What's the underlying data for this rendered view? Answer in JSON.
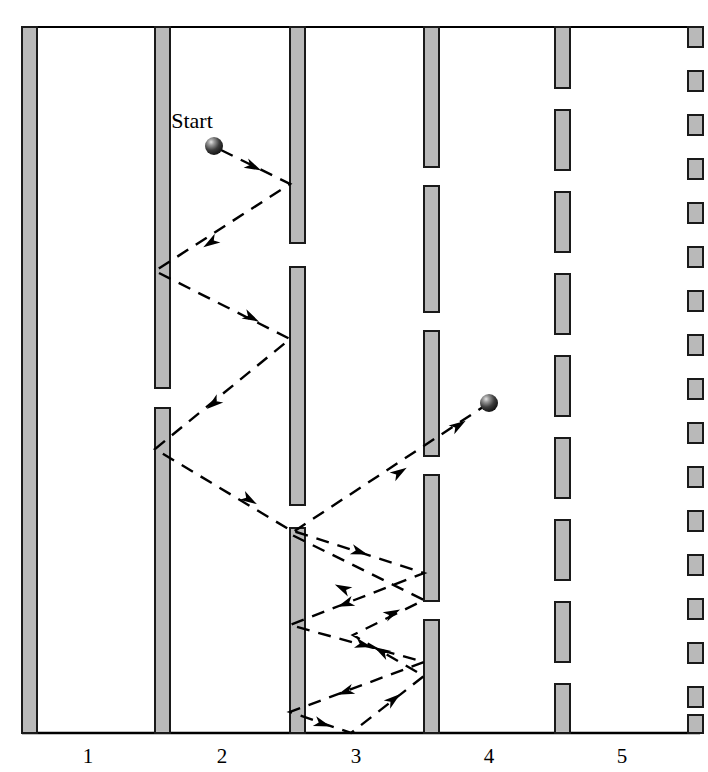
{
  "figure": {
    "title": "",
    "start_label": "Start",
    "axis": {
      "tick_labels": [
        "1",
        "2",
        "3",
        "4",
        "5"
      ],
      "tick_label_x": [
        88,
        222,
        356,
        489,
        622
      ],
      "tick_label_y": 763,
      "baseline_y": 733,
      "baseline_x0": 22,
      "baseline_x1": 700,
      "top_border_y": 27,
      "top_border_x0": 22,
      "top_border_x1": 700
    },
    "colors": {
      "barrier_fill": "#b9b9b9",
      "barrier_stroke": "#1a1a1a",
      "trajectory": "#000000",
      "axis": "#000000",
      "ball_dark": "#141414",
      "ball_mid": "#4a4a4a",
      "ball_highlight": "#d8d8d8",
      "background": "#ffffff"
    },
    "barrier_width": 15,
    "barriers": [
      {
        "name": "column-1-solid",
        "x": 22,
        "segments": [
          [
            27,
            733
          ]
        ]
      },
      {
        "name": "column-2-broken",
        "x": 155,
        "segments": [
          [
            27,
            388
          ],
          [
            408,
            733
          ]
        ]
      },
      {
        "name": "column-3-broken",
        "x": 290,
        "segments": [
          [
            27,
            243
          ],
          [
            267,
            505
          ],
          [
            528,
            733
          ]
        ]
      },
      {
        "name": "column-4-dashed",
        "x": 424,
        "segments": [
          [
            27,
            167
          ],
          [
            186,
            312
          ],
          [
            331,
            456
          ],
          [
            475,
            601
          ],
          [
            620,
            733
          ]
        ]
      },
      {
        "name": "column-5-dashed",
        "x": 555,
        "segments": [
          [
            27,
            88
          ],
          [
            110,
            170
          ],
          [
            192,
            252
          ],
          [
            274,
            334
          ],
          [
            356,
            416
          ],
          [
            438,
            498
          ],
          [
            520,
            580
          ],
          [
            602,
            662
          ],
          [
            684,
            733
          ]
        ]
      },
      {
        "name": "column-6-dotted",
        "x": 688,
        "segments": [
          [
            27,
            47
          ],
          [
            71,
            91
          ],
          [
            115,
            135
          ],
          [
            159,
            179
          ],
          [
            203,
            223
          ],
          [
            247,
            267
          ],
          [
            291,
            311
          ],
          [
            335,
            355
          ],
          [
            379,
            399
          ],
          [
            423,
            443
          ],
          [
            467,
            487
          ],
          [
            511,
            531
          ],
          [
            555,
            575
          ],
          [
            599,
            619
          ],
          [
            643,
            663
          ],
          [
            687,
            707
          ],
          [
            715,
            733
          ]
        ]
      }
    ],
    "balls": [
      {
        "name": "start-ball",
        "cx": 214,
        "cy": 146,
        "r": 9
      },
      {
        "name": "end-ball",
        "cx": 489,
        "cy": 403,
        "r": 9
      }
    ],
    "trajectory": {
      "name": "ball-path",
      "dash_pattern": "13 9",
      "stroke_width": 2.4,
      "points": [
        [
          221,
          150
        ],
        [
          290,
          184
        ],
        [
          155,
          271
        ],
        [
          290,
          339
        ],
        [
          155,
          449
        ],
        [
          290,
          530
        ],
        [
          424,
          573
        ],
        [
          290,
          625
        ],
        [
          424,
          662
        ],
        [
          290,
          712
        ],
        [
          351,
          733
        ],
        [
          424,
          676
        ],
        [
          353,
          635
        ],
        [
          424,
          600
        ],
        [
          290,
          534
        ],
        [
          489,
          403
        ]
      ],
      "arrows": [
        {
          "x": 254,
          "y": 167,
          "angle": 26
        },
        {
          "x": 210,
          "y": 243,
          "angle": 147
        },
        {
          "x": 252,
          "y": 318,
          "angle": 27
        },
        {
          "x": 213,
          "y": 404,
          "angle": 141
        },
        {
          "x": 250,
          "y": 500,
          "angle": 31
        },
        {
          "x": 360,
          "y": 552,
          "angle": 18
        },
        {
          "x": 345,
          "y": 604,
          "angle": 159
        },
        {
          "x": 364,
          "y": 645,
          "angle": 15
        },
        {
          "x": 345,
          "y": 692,
          "angle": 160
        },
        {
          "x": 323,
          "y": 724,
          "angle": 19
        },
        {
          "x": 394,
          "y": 699,
          "angle": 322
        },
        {
          "x": 381,
          "y": 651,
          "angle": 210
        },
        {
          "x": 393,
          "y": 613,
          "angle": 334
        },
        {
          "x": 342,
          "y": 588,
          "angle": 206
        },
        {
          "x": 400,
          "y": 472,
          "angle": 327
        },
        {
          "x": 459,
          "y": 425,
          "angle": 327
        }
      ]
    }
  }
}
